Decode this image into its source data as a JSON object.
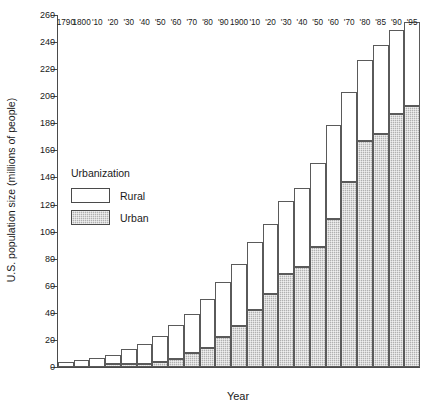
{
  "chart_data": {
    "type": "bar",
    "title": "",
    "subtitle": "",
    "xlabel": "Year",
    "ylabel": "U.S. population size (millions of people)",
    "ylim": [
      0,
      260
    ],
    "ytick_step": 20,
    "yticks": [
      0,
      20,
      40,
      60,
      80,
      100,
      120,
      140,
      160,
      180,
      200,
      220,
      240,
      260
    ],
    "grid": false,
    "stacked": true,
    "legend_position": "inside-upper-left",
    "legend_title": "Urbanization",
    "categories": [
      "1790",
      "1800",
      "'10",
      "'20",
      "'30",
      "'40",
      "'50",
      "'60",
      "'70",
      "'80",
      "'90",
      "1900",
      "'10",
      "'20",
      "'30",
      "'40",
      "'50",
      "'60",
      "'70",
      "'80",
      "'85",
      "'90",
      "'95"
    ],
    "series": [
      {
        "name": "Urban",
        "color": "#b0b0b0",
        "values": [
          0,
          0,
          0,
          2,
          2,
          2,
          3.5,
          6,
          10,
          14,
          22,
          30,
          42,
          54,
          69,
          74,
          89,
          109,
          137,
          167,
          172,
          187,
          193
        ]
      },
      {
        "name": "Rural",
        "color": "#ffffff",
        "values": [
          4,
          5,
          7,
          7,
          11,
          15,
          19.5,
          25,
          29,
          36,
          41,
          46,
          50,
          52,
          54,
          58,
          62,
          70,
          66,
          60,
          66,
          62,
          62
        ]
      }
    ],
    "totals": [
      4,
      5,
      7,
      9,
      13,
      17,
      23,
      31,
      39,
      50,
      63,
      76,
      92,
      106,
      123,
      132,
      151,
      179,
      203,
      227,
      238,
      249,
      255
    ],
    "annotations": []
  },
  "legend": {
    "title": "Urbanization",
    "entries": [
      {
        "label": "Rural",
        "swatch": "white-fill"
      },
      {
        "label": "Urban",
        "swatch": "gray-hatch-fill"
      }
    ]
  },
  "axes": {
    "y_title": "U.S. population size (millions of people)",
    "x_title": "Year"
  }
}
